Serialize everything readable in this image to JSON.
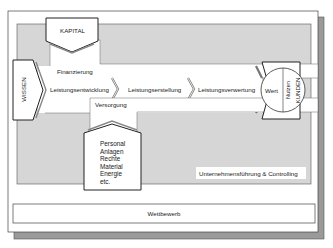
{
  "diagram": {
    "inputs": {
      "top": "KAPITAL",
      "left": "WISSEN",
      "bottom_resources": [
        "Personal",
        "Anlagen",
        "Rechte",
        "Material",
        "Energie",
        "etc."
      ]
    },
    "flows": {
      "financing": "Finanzierung",
      "supply": "Versorgung"
    },
    "process_chain": [
      "Leistungsentwicklung",
      "Leistungserstellung",
      "Leistungsverwertung"
    ],
    "output": {
      "value": "Wert",
      "benefit": "Nutzen",
      "customers": "KUNDEN"
    },
    "management_label": "Unternehmensführung & Controlling",
    "environment_label": "Wettbewerb"
  },
  "colors": {
    "panel_gray": "#d6d6d6",
    "shadow_gray": "#9a9a9a",
    "stroke": "#333333",
    "white": "#ffffff"
  }
}
